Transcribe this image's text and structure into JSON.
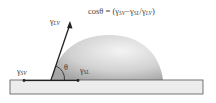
{
  "diagram": {
    "formula": {
      "lhs": "cosθ",
      "equals": "=",
      "open": "(",
      "t1": "γ",
      "t1_sub": "SV",
      "minus": "−",
      "t2": "γ",
      "t2_sub": "SL",
      "slash": "/",
      "t3": "γ",
      "t3_sub": "LV",
      "close": ")"
    },
    "labels": {
      "gamma_lv": {
        "symbol": "γ",
        "sub": "LV"
      },
      "gamma_sv": {
        "symbol": "γ",
        "sub": "SV"
      },
      "gamma_sl": {
        "symbol": "γ",
        "sub": "SL"
      },
      "theta": "θ"
    },
    "colors": {
      "substrate_fill": "#ececec",
      "substrate_stroke": "#555555",
      "droplet_light": "#f2f2f2",
      "droplet_dark": "#a8a8a8",
      "arrow": "#222222"
    }
  }
}
